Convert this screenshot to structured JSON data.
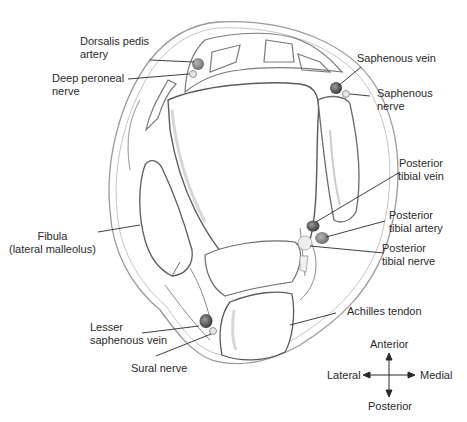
{
  "labels": {
    "dorsalis_pedis_artery": "Dorsalis pedis\nartery",
    "deep_peroneal_nerve": "Deep peroneal\nnerve",
    "saphenous_vein": "Saphenous vein",
    "saphenous_nerve": "Saphenous\nnerve",
    "posterior_tibial_vein": "Posterior\ntibial vein",
    "posterior_tibial_artery": "Posterior\ntibial artery",
    "posterior_tibial_nerve": "Posterior\ntibial nerve",
    "fibula": "Fibula\n(lateral malleolus)",
    "lesser_saphenous_vein": "Lesser\nsaphenous vein",
    "sural_nerve": "Sural nerve",
    "achilles_tendon": "Achilles tendon"
  },
  "compass": {
    "anterior": "Anterior",
    "posterior": "Posterior",
    "lateral": "Lateral",
    "medial": "Medial"
  },
  "colors": {
    "outline": "#8a8a8a",
    "bone_edge": "#5a5a5a",
    "vein": "#4a4a4a",
    "artery": "#6a6a6a",
    "nerve": "#d8d8d8",
    "text": "#2a2a2a"
  }
}
